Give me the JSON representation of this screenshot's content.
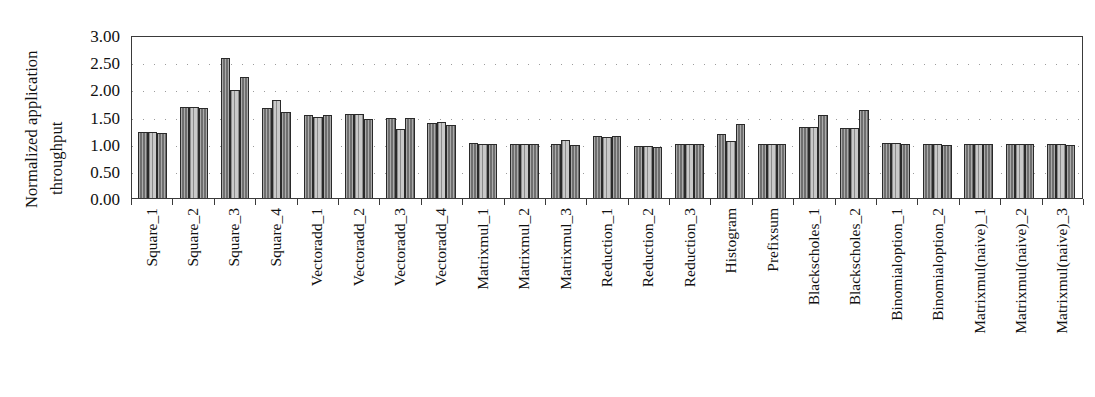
{
  "chart_data": {
    "type": "bar",
    "title": "",
    "xlabel": "",
    "ylabel": "Normalized application throughput",
    "ylabel_lines": [
      "Normalized application",
      "throughput"
    ],
    "ylim": [
      0.0,
      3.0
    ],
    "ytick_labels": [
      "3.00",
      "2.50",
      "2.00",
      "1.50",
      "1.00",
      "0.50",
      "0.00"
    ],
    "ytick_values": [
      3.0,
      2.5,
      2.0,
      1.5,
      1.0,
      0.5,
      0.0
    ],
    "grid": true,
    "grid_style": "dotted-horizontal",
    "legend": "none",
    "categories": [
      "Square_1",
      "Square_2",
      "Square_3",
      "Square_4",
      "Vectoradd_1",
      "Vectoradd_2",
      "Vectoradd_3",
      "Vectoradd_4",
      "Matrixmul_1",
      "Matrixmul_2",
      "Matrixmul_3",
      "Reduction_1",
      "Reduction_2",
      "Reduction_3",
      "Histogram",
      "Prefixsum",
      "Blackscholes_1",
      "Blackscholes_2",
      "Binomialoption_1",
      "Binomialoption_2",
      "Matrixmul(naive)_1",
      "Matrixmul(naive)_2",
      "Matrixmul(naive)_3"
    ],
    "series": [
      {
        "name": "series-1",
        "fill": "dark",
        "values": [
          1.22,
          1.67,
          2.58,
          1.66,
          1.53,
          1.55,
          1.48,
          1.38,
          1.01,
          1.0,
          1.0,
          1.15,
          0.95,
          1.0,
          1.18,
          1.0,
          1.3,
          1.28,
          1.01,
          0.99,
          1.0,
          1.0,
          1.0
        ]
      },
      {
        "name": "series-2",
        "fill": "light",
        "values": [
          1.22,
          1.67,
          1.98,
          1.8,
          1.5,
          1.55,
          1.27,
          1.4,
          1.0,
          0.99,
          1.07,
          1.12,
          0.95,
          1.0,
          1.05,
          1.0,
          1.3,
          1.28,
          1.01,
          0.99,
          1.0,
          1.0,
          1.0
        ]
      },
      {
        "name": "series-3",
        "fill": "dark",
        "values": [
          1.2,
          1.66,
          2.22,
          1.58,
          1.53,
          1.45,
          1.48,
          1.34,
          1.0,
          1.0,
          0.98,
          1.15,
          0.94,
          1.0,
          1.37,
          1.0,
          1.52,
          1.62,
          1.0,
          0.98,
          1.0,
          1.0,
          0.98
        ]
      }
    ]
  }
}
